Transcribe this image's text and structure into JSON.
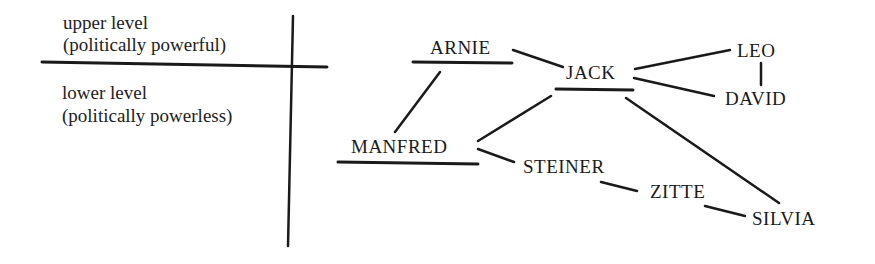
{
  "legend": {
    "upper_line1": "upper level",
    "upper_line2": "(politically powerful)",
    "lower_line1": "lower level",
    "lower_line2": "(politically powerless)"
  },
  "nodes": {
    "arnie": "ARNIE",
    "jack": "JACK",
    "leo": "LEO",
    "david": "DAVID",
    "manfred": "MANFRED",
    "steiner": "STEINER",
    "zitte": "ZITTE",
    "silvia": "SILVIA"
  },
  "edges": [
    [
      "ARNIE",
      "JACK"
    ],
    [
      "ARNIE",
      "MANFRED"
    ],
    [
      "JACK",
      "LEO"
    ],
    [
      "JACK",
      "DAVID"
    ],
    [
      "LEO",
      "DAVID"
    ],
    [
      "JACK",
      "MANFRED"
    ],
    [
      "JACK",
      "SILVIA"
    ],
    [
      "MANFRED",
      "STEINER"
    ],
    [
      "STEINER",
      "ZITTE"
    ],
    [
      "ZITTE",
      "SILVIA"
    ]
  ],
  "underlined_nodes": [
    "ARNIE",
    "JACK",
    "MANFRED"
  ],
  "colors": {
    "ink": "#1a1a1a",
    "background": "#ffffff"
  }
}
